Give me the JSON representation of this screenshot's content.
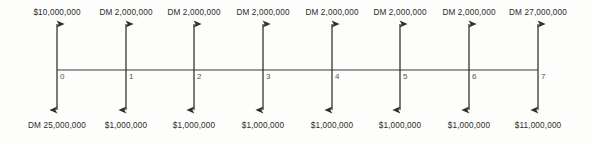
{
  "diagram": {
    "type": "cash-flow-timeline",
    "axis": {
      "x_start": 57,
      "x_end": 538,
      "y": 70,
      "spacing": 68.7,
      "stroke_color": "#3a3a38"
    },
    "arrow": {
      "top_tip_y": 24,
      "bottom_tip_y": 110,
      "stroke_color": "#2e2e2c"
    },
    "periods": [
      {
        "number": "0",
        "x": 57,
        "inflow": "$10,000,000",
        "outflow": "DM 25,000,000"
      },
      {
        "number": "1",
        "x": 126,
        "inflow": "DM 2,000,000",
        "outflow": "$1,000,000"
      },
      {
        "number": "2",
        "x": 194,
        "inflow": "DM 2,000,000",
        "outflow": "$1,000,000"
      },
      {
        "number": "3",
        "x": 263,
        "inflow": "DM 2,000,000",
        "outflow": "$1,000,000"
      },
      {
        "number": "4",
        "x": 332,
        "inflow": "DM 2,000,000",
        "outflow": "$1,000,000"
      },
      {
        "number": "5",
        "x": 400,
        "inflow": "DM 2,000,000",
        "outflow": "$1,000,000"
      },
      {
        "number": "6",
        "x": 469,
        "inflow": "DM 2,000,000",
        "outflow": "$1,000,000"
      },
      {
        "number": "7",
        "x": 538,
        "inflow": "DM 27,000,000",
        "outflow": "$11,000,000"
      }
    ]
  }
}
